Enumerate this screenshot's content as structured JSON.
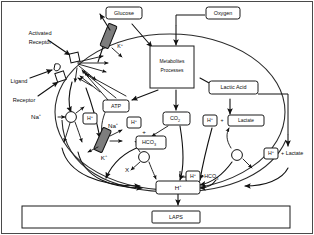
{
  "figure": {
    "outer_frame": true,
    "cell_shape": "ellipse"
  },
  "external_labels": {
    "activated_receptor": "Activated",
    "activated_receptor_2": "Receptor",
    "ligand": "Ligand",
    "receptor": "Receptor"
  },
  "boxes": {
    "glucose": "Glucose",
    "oxygen": "Oxygen",
    "metabolites_line1": "Metabolites",
    "metabolites_line2": "Processes",
    "lactic_acid": "Lactic Acid",
    "atp": "ATP",
    "co2": "CO",
    "co2_sub": "2",
    "hco3": "HCO",
    "hco3_sub": "3",
    "h_plus_inner": "H",
    "h_plus_sup": "+",
    "laps": "LAPS"
  },
  "ions": {
    "na_left": "Na",
    "na_left_sup": "+",
    "na_mid": "Na",
    "na_mid_sup": "+",
    "k_top": "K",
    "k_top_sup": "+",
    "k_bottom": "K",
    "k_bottom_sup": "+",
    "h_a": "H",
    "h_a_sup": "+",
    "h_b": "H",
    "h_b_sup": "+",
    "h_lactate_in": "H",
    "h_lactate_in_sup": "+",
    "h_hco3": "H",
    "h_hco3_sup": "+",
    "h_out": "H",
    "h_out_sup": "+",
    "x_marker": "X",
    "plus_sign": "+"
  },
  "compound_labels": {
    "lactate_inner": "Lactate",
    "lactate_outer": "+ Lactate",
    "hco3_suffix": "+HCO",
    "hco3_suffix_sub": "3"
  }
}
